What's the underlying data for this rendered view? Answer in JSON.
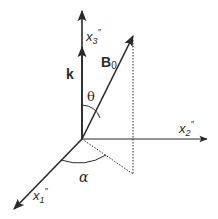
{
  "figure": {
    "type": "3D coordinate diagram",
    "colors": {
      "line": "#2a2a2a",
      "background": "#ffffff"
    },
    "axes": {
      "x1": {
        "label": "x",
        "subscript": "1",
        "prime": "″"
      },
      "x2": {
        "label": "x",
        "subscript": "2",
        "prime": "″"
      },
      "x3": {
        "label": "x",
        "subscript": "3",
        "prime": "″"
      }
    },
    "vectors": {
      "k": {
        "label": "k"
      },
      "B0": {
        "label": "B",
        "subscript": "0"
      }
    },
    "angles": {
      "theta": {
        "label": "θ"
      },
      "alpha": {
        "label": "α"
      }
    }
  }
}
